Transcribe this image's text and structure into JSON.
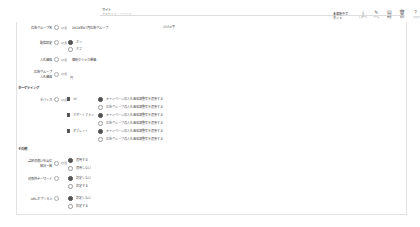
{
  "header": {
    "title": "サイト",
    "subtitle": "アカウント・ソリッド"
  },
  "toolbar": {
    "status_label": "未編集中ボタン ▾",
    "buttons": [
      {
        "icon": "download-icon",
        "glyph": "⤓",
        "label": "レポート"
      },
      {
        "icon": "edit-icon",
        "glyph": "✎",
        "label": "ツール"
      },
      {
        "icon": "document-icon",
        "glyph": "▤",
        "label": "管理"
      },
      {
        "icon": "delete-icon",
        "glyph": "🗑",
        "label": "削除"
      },
      {
        "icon": "help-icon",
        "glyph": "?",
        "label": "ヘルプ"
      }
    ]
  },
  "form": {
    "ad_group_name": {
      "label": "広告グループ名",
      "required": "必須",
      "value": "2019年07月広告グループ",
      "counter": "15/50字"
    },
    "delivery_status": {
      "label": "配信設定",
      "required": "必須",
      "options": [
        "オン",
        "オフ"
      ],
      "selected": 0
    },
    "bid_strategy": {
      "label": "入札価格",
      "required": "必須",
      "value": "個別クリック単価"
    },
    "ad_group_bid": {
      "label": "広告グループ\n入札価格",
      "required": "必須",
      "value": "円"
    },
    "targeting_section": "ターゲティング",
    "devices": {
      "label": "デバイス",
      "required": "必須",
      "items": [
        {
          "name": "PC",
          "checked": true,
          "options": [
            "キャンペーンの入札価格調整率を適用する",
            "広告グループの入札価格調整率を適用する"
          ],
          "selected": 0
        },
        {
          "name": "スマートフォン",
          "checked": true,
          "options": [
            "キャンペーンの入札価格調整率を適用する",
            "広告グループの入札価格調整率を適用する"
          ],
          "selected": 0
        },
        {
          "name": "タブレット",
          "checked": true,
          "options": [
            "キャンペーンの入札価格調整率を適用する",
            "広告グループの入札価格調整率を適用する"
          ],
          "selected": 0
        }
      ]
    },
    "other_section": "その他",
    "phrase_match": {
      "label": "語順の違いを含む\n部分一致",
      "required": "必須",
      "options": [
        "適用する",
        "適用しない"
      ],
      "selected": 0
    },
    "exclude_keywords": {
      "label": "対象外キーワード",
      "options": [
        "設定しない",
        "設定する"
      ],
      "selected": 0
    },
    "url_option": {
      "label": "URLオプション",
      "options": [
        "設定しない",
        "設定する"
      ],
      "selected": 0
    }
  }
}
